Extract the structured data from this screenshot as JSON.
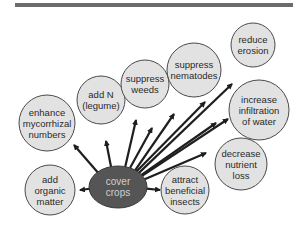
{
  "colors": {
    "top_bar": "#6b6b6b",
    "node_fill": "#e2e2e2",
    "node_stroke": "#4a4a4a",
    "center_fill": "#555555",
    "center_text": "#cfcfcf",
    "arrow": "#1e1e1e"
  },
  "center": {
    "label": "cover\ncrops",
    "line1": "cover",
    "line2": "crops",
    "cx": 118,
    "cy": 187,
    "rx": 29,
    "ry": 21
  },
  "nodes": [
    {
      "id": "add-organic-matter",
      "lines": [
        "add",
        "organic",
        "matter"
      ],
      "cx": 50,
      "cy": 190,
      "r": 25,
      "arrow_to": [
        80,
        190
      ]
    },
    {
      "id": "enhance-mycorrhizal-numbers",
      "lines": [
        "enhance",
        "mycorrhizal",
        "numbers"
      ],
      "cx": 47,
      "cy": 123,
      "r": 28,
      "arrow_to": [
        74,
        145
      ]
    },
    {
      "id": "add-n-legume",
      "lines": [
        "add N",
        "(legume)"
      ],
      "cx": 101,
      "cy": 100,
      "r": 24,
      "arrow_to": [
        106,
        141
      ]
    },
    {
      "id": "suppress-weeds",
      "lines": [
        "suppress",
        "weeds"
      ],
      "cx": 145,
      "cy": 84,
      "r": 24,
      "arrow_to": [
        136,
        120
      ]
    },
    {
      "id": "suppress-nematodes",
      "lines": [
        "suppress",
        "nematodes"
      ],
      "cx": 194,
      "cy": 70,
      "r": 27,
      "arrow_to": [
        174,
        114
      ]
    },
    {
      "id": "reduce-erosion",
      "lines": [
        "reduce",
        "erosion"
      ],
      "cx": 253,
      "cy": 45,
      "r": 22,
      "arrow_to": [
        232,
        84
      ]
    },
    {
      "id": "increase-infiltration-of-water",
      "lines": [
        "increase",
        "infiltration",
        "of water"
      ],
      "cx": 259,
      "cy": 110,
      "r": 30,
      "arrow_to": [
        228,
        119
      ]
    },
    {
      "id": "decrease-nutrient-loss",
      "lines": [
        "decrease",
        "nutrient",
        "loss"
      ],
      "cx": 241,
      "cy": 164,
      "r": 26,
      "arrow_to": [
        206,
        153
      ]
    },
    {
      "id": "attract-beneficial-insects",
      "lines": [
        "attract",
        "beneficial",
        "insects"
      ],
      "cx": 185,
      "cy": 190,
      "r": 24,
      "arrow_to": [
        160,
        190
      ]
    }
  ],
  "extra_arrows": [
    {
      "from": [
        130,
        168
      ],
      "to": [
        152,
        128
      ]
    },
    {
      "from": [
        136,
        172
      ],
      "to": [
        205,
        102
      ]
    },
    {
      "from": [
        140,
        176
      ],
      "to": [
        216,
        123
      ]
    }
  ]
}
